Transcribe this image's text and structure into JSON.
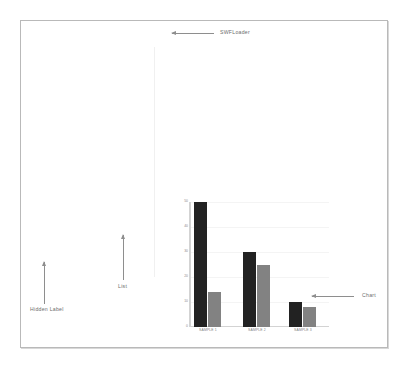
{
  "frame": {
    "name": "application-frame"
  },
  "annotations": [
    {
      "id": "swfloader",
      "label": "SWFLoader",
      "arrow": "left"
    },
    {
      "id": "hidden-label",
      "label": "Hidden Label",
      "arrow": "up"
    },
    {
      "id": "list",
      "label": "List",
      "arrow": "up"
    },
    {
      "id": "chart",
      "label": "Chart",
      "arrow": "left"
    }
  ],
  "chart_data": {
    "type": "bar",
    "title": "",
    "subtitle": "",
    "xlabel": "",
    "ylabel": "",
    "categories": [
      "SAMPLE 1",
      "SAMPLE 2",
      "SAMPLE 3"
    ],
    "series": [
      {
        "name": "Series 1",
        "color": "#222222",
        "values": [
          50,
          30,
          10
        ]
      },
      {
        "name": "Series 2",
        "color": "#828282",
        "values": [
          14,
          25,
          8
        ]
      }
    ],
    "ylim": [
      0,
      50
    ],
    "yticks": [
      0,
      10,
      20,
      30,
      40,
      50
    ],
    "ytick_labels": [
      "0",
      "10",
      "20",
      "30",
      "40",
      "50"
    ],
    "grid": true,
    "legend": false,
    "legend_position": "none"
  },
  "colors": {
    "series_1": "#222222",
    "series_2": "#828282",
    "frame_border": "#b9b9b9",
    "axis": "#d3d3d3",
    "annotation_text": "#6d6d6d",
    "tick_text": "#8a8a8a"
  }
}
